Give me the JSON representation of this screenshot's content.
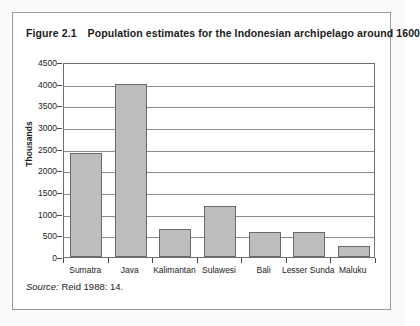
{
  "figure": {
    "number": "Figure 2.1",
    "title": "Population estimates for the Indonesian archipelago around 1600",
    "source_label": "Source:",
    "source_text": "Reid 1988: 14."
  },
  "colors": {
    "bar_fill": "#bdbdbd",
    "bar_border": "#6a6a6a",
    "frame": "#6f6f6f",
    "gridline": "#8c8c8c",
    "box_border": "#9a9a9a",
    "text": "#1b1b1b"
  },
  "chart_data": {
    "type": "bar",
    "title": "Population estimates for the Indonesian archipelago around 1600",
    "xlabel": "",
    "ylabel": "Thousands",
    "ylim": [
      0,
      4500
    ],
    "ytick_step": 500,
    "yticks": [
      0,
      500,
      1000,
      1500,
      2000,
      2500,
      3000,
      3500,
      4000,
      4500
    ],
    "ytick_labels": [
      "0",
      "500",
      "1000",
      "1500",
      "2000",
      "2500",
      "3000",
      "3500",
      "4000",
      "4500"
    ],
    "grid": true,
    "legend": false,
    "categories": [
      "Sumatra",
      "Java",
      "Kalimantan",
      "Sulawesi",
      "Bali",
      "Lesser Sunda",
      "Maluku"
    ],
    "values": [
      2400,
      4000,
      650,
      1180,
      570,
      570,
      250
    ],
    "units": "thousands of people",
    "source": "Reid 1988: 14."
  }
}
